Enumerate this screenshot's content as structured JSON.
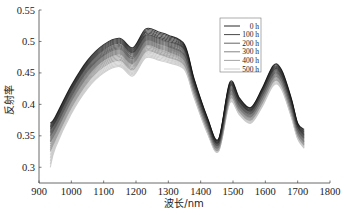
{
  "chart_data": {
    "type": "line",
    "title": "",
    "xlabel": "波长/nm",
    "ylabel": "反射率",
    "xlim": [
      900,
      1800
    ],
    "ylim": [
      0.275,
      0.55
    ],
    "xticks": [
      900,
      1000,
      1100,
      1200,
      1300,
      1400,
      1500,
      1600,
      1700,
      1800
    ],
    "yticks": [
      0.3,
      0.35,
      0.4,
      0.45,
      0.5,
      0.55
    ],
    "ytick_labels": [
      "0.3",
      "0.35",
      "0.4",
      "0.45",
      "0.5",
      "0.55"
    ],
    "grid": false,
    "legend_position": "upper right (inside)",
    "x": [
      935,
      950,
      1000,
      1050,
      1100,
      1150,
      1190,
      1230,
      1270,
      1300,
      1350,
      1380,
      1420,
      1455,
      1490,
      1520,
      1555,
      1590,
      1625,
      1650,
      1680,
      1700,
      1720
    ],
    "series": [
      {
        "name": "0 h",
        "color": "#111111",
        "values": [
          0.37,
          0.38,
          0.43,
          0.47,
          0.495,
          0.505,
          0.49,
          0.52,
          0.515,
          0.51,
          0.495,
          0.44,
          0.38,
          0.345,
          0.435,
          0.41,
          0.395,
          0.425,
          0.462,
          0.455,
          0.41,
          0.37,
          0.36
        ]
      },
      {
        "name": "100 h",
        "color": "#333333",
        "values": [
          0.36,
          0.372,
          0.422,
          0.462,
          0.487,
          0.497,
          0.482,
          0.51,
          0.505,
          0.5,
          0.487,
          0.434,
          0.375,
          0.34,
          0.428,
          0.404,
          0.39,
          0.42,
          0.455,
          0.448,
          0.404,
          0.365,
          0.352
        ]
      },
      {
        "name": "200 h",
        "color": "#555555",
        "values": [
          0.35,
          0.363,
          0.413,
          0.453,
          0.478,
          0.488,
          0.473,
          0.502,
          0.497,
          0.492,
          0.478,
          0.428,
          0.37,
          0.336,
          0.42,
          0.398,
          0.385,
          0.414,
          0.448,
          0.442,
          0.398,
          0.36,
          0.346
        ]
      },
      {
        "name": "300 h",
        "color": "#777777",
        "values": [
          0.34,
          0.354,
          0.405,
          0.445,
          0.47,
          0.48,
          0.465,
          0.494,
          0.489,
          0.484,
          0.47,
          0.422,
          0.365,
          0.332,
          0.414,
          0.393,
          0.38,
          0.408,
          0.442,
          0.436,
          0.392,
          0.355,
          0.34
        ]
      },
      {
        "name": "400 h",
        "color": "#9a9a9a",
        "values": [
          0.325,
          0.343,
          0.395,
          0.435,
          0.46,
          0.47,
          0.455,
          0.484,
          0.48,
          0.475,
          0.462,
          0.416,
          0.36,
          0.328,
          0.408,
          0.388,
          0.375,
          0.402,
          0.436,
          0.43,
          0.386,
          0.35,
          0.335
        ]
      },
      {
        "name": "500 h",
        "color": "#c8c8c8",
        "values": [
          0.3,
          0.33,
          0.385,
          0.425,
          0.45,
          0.46,
          0.445,
          0.474,
          0.47,
          0.466,
          0.455,
          0.41,
          0.355,
          0.325,
          0.402,
          0.383,
          0.37,
          0.396,
          0.43,
          0.424,
          0.38,
          0.345,
          0.33
        ]
      }
    ]
  },
  "legend": {
    "items": [
      "0 h",
      "100 h",
      "200 h",
      "300 h",
      "400 h",
      "500 h"
    ]
  }
}
